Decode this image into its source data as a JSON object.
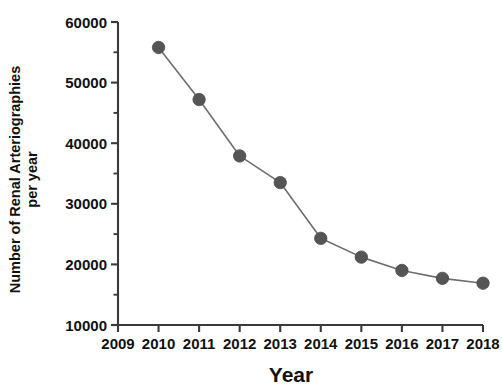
{
  "chart_data": {
    "type": "line",
    "title": "",
    "xlabel": "Year",
    "ylabel_lines": [
      "Number of Renal Arteriographies",
      "per year"
    ],
    "ylabel": "Number of Renal Arteriographies per year",
    "x": [
      2010,
      2011,
      2012,
      2013,
      2014,
      2015,
      2016,
      2017,
      2018
    ],
    "values": [
      55800,
      47200,
      37900,
      33500,
      24300,
      21200,
      19000,
      17700,
      16900
    ],
    "series": [
      {
        "name": "Renal arteriographies per year",
        "values": [
          55800,
          47200,
          37900,
          33500,
          24300,
          21200,
          19000,
          17700,
          16900
        ]
      }
    ],
    "xlim": [
      2009,
      2018
    ],
    "ylim": [
      10000,
      60000
    ],
    "xticks": [
      2009,
      2010,
      2011,
      2012,
      2013,
      2014,
      2015,
      2016,
      2017,
      2018
    ],
    "xtick_labels": [
      "2009",
      "2010",
      "2011",
      "2012",
      "2013",
      "2014",
      "2015",
      "2016",
      "2017",
      "2018"
    ],
    "yticks": [
      10000,
      20000,
      30000,
      40000,
      50000,
      60000
    ],
    "ytick_labels": [
      "10000",
      "20000",
      "30000",
      "40000",
      "50000",
      "60000"
    ],
    "y_minor_ticks": [
      15000,
      25000,
      35000,
      45000,
      55000
    ],
    "grid": false,
    "legend": false,
    "legend_position": "none",
    "marker": "circle",
    "colors": {
      "marker": "#555555",
      "line": "#6e6e6e",
      "axis": "#3a3a3a",
      "text": "#111111",
      "background": "#ffffff"
    }
  }
}
